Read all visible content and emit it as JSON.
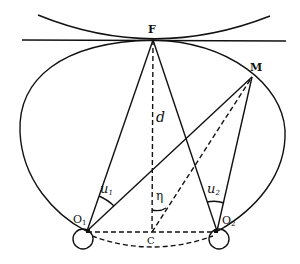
{
  "diagram": {
    "points": {
      "F": {
        "label": "F",
        "x": 153,
        "y": 40
      },
      "M": {
        "label": "M",
        "x": 252,
        "y": 77
      },
      "O1": {
        "label": "O",
        "sub": "1",
        "x": 87,
        "y": 231
      },
      "O2": {
        "label": "O",
        "sub": "2",
        "x": 217,
        "y": 231
      },
      "C": {
        "label": "C",
        "x": 152,
        "y": 232
      }
    },
    "labels": {
      "d": "d",
      "u1": "u",
      "u1_sub": "1",
      "u2": "u",
      "u2_sub": "2",
      "eta": "η"
    },
    "colors": {
      "stroke": "#111111",
      "background": "#ffffff"
    }
  }
}
